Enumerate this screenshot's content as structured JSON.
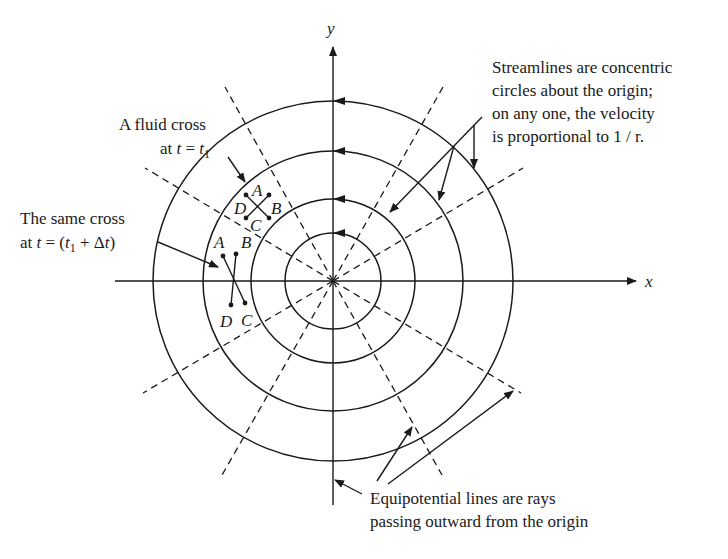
{
  "axes": {
    "x_label": "x",
    "y_label": "y",
    "origin": [
      333,
      281
    ]
  },
  "streamline_radii": [
    48,
    81,
    128,
    178
  ],
  "equipotential_ray_angles_deg": [
    30,
    60,
    120,
    150,
    210,
    240,
    300,
    330
  ],
  "annotations": {
    "streamlines": {
      "lines": [
        "Streamlines are concentric",
        "circles about the origin;",
        "on any one, the velocity",
        "is proportional to 1 / r."
      ]
    },
    "fluid_cross_t1": {
      "line1": "A fluid cross",
      "line2_prefix": "at ",
      "t": "t",
      "equals": " = ",
      "t1": "t",
      "t1_sub": "1"
    },
    "same_cross": {
      "line1": "The same cross",
      "line2_prefix": "at ",
      "t": "t",
      "equals": " = (",
      "t1": "t",
      "t1_sub": "1",
      "plus": " + Δ",
      "dt": "t",
      "close": ")"
    },
    "equipotential": {
      "lines": [
        "Equipotential lines are rays",
        "passing outward from the origin"
      ]
    }
  },
  "cross_t1": {
    "labels": {
      "A": "A",
      "B": "B",
      "C": "C",
      "D": "D"
    }
  },
  "cross_t2": {
    "labels": {
      "A": "A",
      "B": "B",
      "C": "C",
      "D": "D"
    }
  },
  "colors": {
    "ink": "#1a1a1a",
    "background": "#ffffff"
  }
}
